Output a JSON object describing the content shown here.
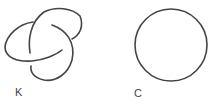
{
  "figures": [
    {
      "name": "trefoil-knot",
      "label": "K"
    },
    {
      "name": "unknot-circle",
      "label": "C"
    }
  ],
  "colors": {
    "stroke": "#444444",
    "text": "#444444"
  }
}
